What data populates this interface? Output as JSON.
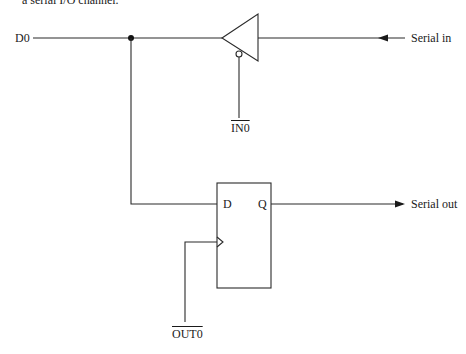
{
  "caption": {
    "text": "a serial I/O channel."
  },
  "signals": {
    "d0": "D0",
    "serial_in": "Serial in",
    "serial_out": "Serial out",
    "in0": "IN0",
    "out0": "OUT0"
  },
  "flip_flop": {
    "d_pin": "D",
    "q_pin": "Q"
  },
  "components": [
    {
      "type": "tri-state-buffer",
      "direction": "right-to-left",
      "enable": "IN0",
      "enable_active_low": true
    },
    {
      "type": "d-flip-flop",
      "data": "D",
      "output": "Q",
      "clock": "OUT0",
      "clock_active_low": true
    }
  ],
  "colors": {
    "line": "#2a2a2a",
    "background": "#ffffff"
  }
}
